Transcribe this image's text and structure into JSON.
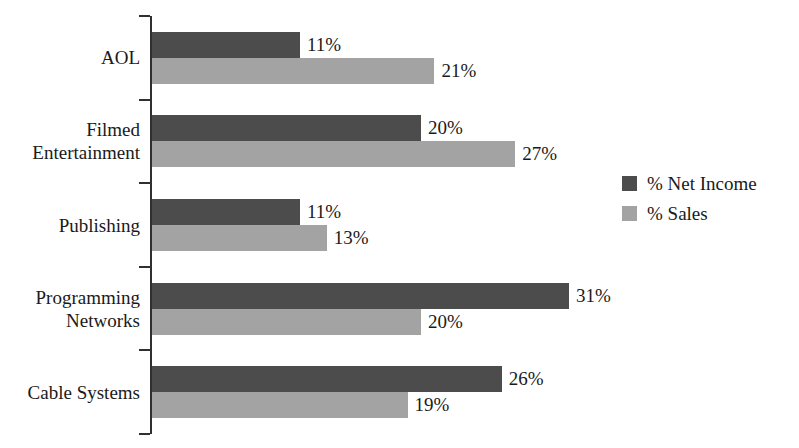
{
  "chart_data": {
    "type": "bar",
    "orientation": "horizontal",
    "title": "",
    "subtitle": "",
    "xlabel": "",
    "ylabel": "",
    "grid": false,
    "axis_visible": true,
    "value_labels": true,
    "value_suffix": "%",
    "xlim": [
      0,
      31
    ],
    "categories": [
      "AOL",
      "Filmed\nEntertainment",
      "Publishing",
      "Programming\nNetworks",
      "Cable Systems"
    ],
    "series": [
      {
        "name": "% Net Income",
        "color": "#4c4c4c",
        "values": [
          11,
          20,
          11,
          31,
          26
        ],
        "labels": [
          "11%",
          "20%",
          "11%",
          "31%",
          "26%"
        ]
      },
      {
        "name": "% Sales",
        "color": "#a3a3a3",
        "values": [
          21,
          27,
          13,
          20,
          19
        ],
        "labels": [
          "21%",
          "27%",
          "13%",
          "20%",
          "19%"
        ]
      }
    ],
    "legend": {
      "position": "right",
      "entries": [
        {
          "label": "% Net Income",
          "color": "#4c4c4c"
        },
        {
          "label": "% Sales",
          "color": "#a3a3a3"
        }
      ]
    },
    "colors": {
      "background": "#ffffff",
      "axis": "#303030",
      "text": "#1a1a1a",
      "series_net_income": "#4c4c4c",
      "series_sales": "#a3a3a3"
    }
  }
}
